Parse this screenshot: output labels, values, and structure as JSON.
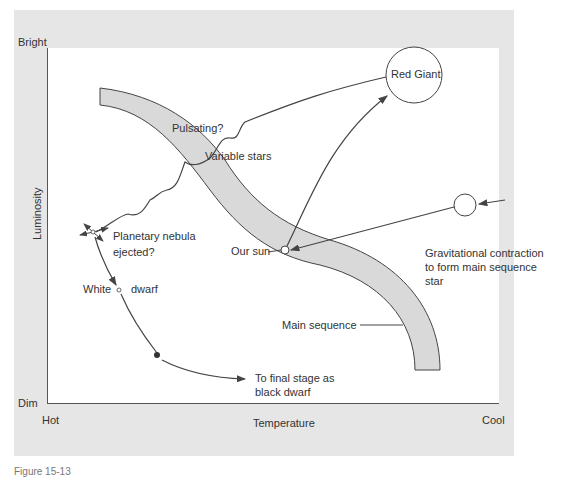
{
  "axes": {
    "y_top": "Bright",
    "y_bottom": "Dim",
    "y_label": "Luminosity",
    "x_left": "Hot",
    "x_right": "Cool",
    "x_label": "Temperature"
  },
  "labels": {
    "red_giant": "Red Giant",
    "pulsating": "Pulsating?",
    "variable_stars": "Variable stars",
    "planetary_nebula_1": "Planetary nebula",
    "planetary_nebula_2": "ejected?",
    "our_sun": "Our sun",
    "white": "White",
    "dwarf": "dwarf",
    "gravitational_1": "Gravitational contraction",
    "gravitational_2": "to form main sequence",
    "gravitational_3": "star",
    "main_sequence": "Main sequence",
    "black_dwarf_1": "To final stage as",
    "black_dwarf_2": "black dwarf"
  },
  "colors": {
    "frame": "#e6e6e6",
    "band_fill": "#d9d9d9",
    "line": "#444444"
  },
  "caption": "Figure 15-13"
}
